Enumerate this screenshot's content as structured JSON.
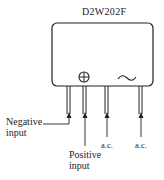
{
  "diagram": {
    "part_number": "D2W202F",
    "symbols": {
      "positive": "⊕",
      "ac": "~"
    },
    "pins": [
      {
        "id": "negative",
        "label_line1": "Negative",
        "label_line2": "input"
      },
      {
        "id": "positive",
        "label_line1": "Positive",
        "label_line2": "input"
      },
      {
        "id": "ac1",
        "label_line1": "a.c."
      },
      {
        "id": "ac2",
        "label_line1": "a.c."
      }
    ],
    "colors": {
      "stroke": "#222222",
      "background": "#ffffff"
    }
  }
}
